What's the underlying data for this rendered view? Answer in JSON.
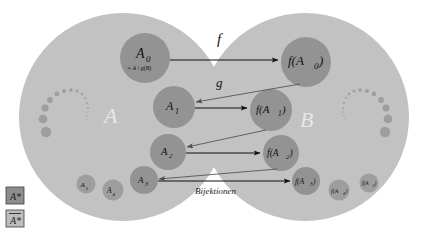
{
  "diagram": {
    "caption": "Bijektionen",
    "colors": {
      "background": "#ffffff",
      "set_fill": "#c2c2c2",
      "subset_fill": "#939393",
      "subset_fill_light": "#9e9e9e",
      "arrow_dark": "#101010",
      "arrow_light": "#5a5a5a",
      "set_label_text": "#e8e8e8",
      "math_text": "#111111",
      "legend_box_dark": "#8d8d8d",
      "legend_box_light": "#bdbdbd",
      "legend_border": "#4a4a4a"
    },
    "sets": [
      {
        "id": "A",
        "label": "A"
      },
      {
        "id": "B",
        "label": "B"
      }
    ],
    "function_labels": [
      {
        "id": "f",
        "label": "f"
      },
      {
        "id": "g",
        "label": "g"
      }
    ],
    "left_subsets": [
      {
        "id": "A0",
        "label": "A",
        "sub": "0",
        "note": "= A \\ g(B)"
      },
      {
        "id": "A1",
        "label": "A",
        "sub": "1",
        "note": ""
      },
      {
        "id": "A2",
        "label": "A",
        "sub": "2",
        "note": ""
      },
      {
        "id": "A3",
        "label": "A",
        "sub": "3",
        "note": ""
      },
      {
        "id": "A4",
        "label": "A",
        "sub": "4",
        "note": ""
      },
      {
        "id": "A5",
        "label": "A",
        "sub": "5",
        "note": ""
      }
    ],
    "right_subsets": [
      {
        "id": "fA0",
        "label": "f(A",
        "sub": "0",
        "close": ")"
      },
      {
        "id": "fA1",
        "label": "f(A",
        "sub": "1",
        "close": ")"
      },
      {
        "id": "fA2",
        "label": "f(A",
        "sub": "2",
        "close": ")"
      },
      {
        "id": "fA3",
        "label": "f(A",
        "sub": "3",
        "close": ")"
      },
      {
        "id": "fA4",
        "label": "f(A",
        "sub": "4",
        "close": ")"
      },
      {
        "id": "fA5",
        "label": "f(A",
        "sub": "5",
        "close": ")"
      }
    ],
    "legend": [
      {
        "id": "legend-astar-dark",
        "label": "A*",
        "style": "dark"
      },
      {
        "id": "legend-astar-bar",
        "label": "A*",
        "style": "overlined"
      }
    ],
    "texts": {
      "A0_main": "A",
      "A0_sub": "0",
      "A0_note": "= A \\ g(B)",
      "A1_main": "A",
      "A1_sub": "1",
      "A2_main": "A",
      "A2_sub": "2",
      "A3_main": "A",
      "A3_sub": "3",
      "A4_main": "A",
      "A4_sub": "4",
      "A5_main": "A",
      "A5_sub": "5",
      "fA0_main": "f(A",
      "fA0_sub": "0",
      "fA0_close": ")",
      "fA1_main": "f(A",
      "fA1_sub": "1",
      "fA1_close": ")",
      "fA2_main": "f(A",
      "fA2_sub": "2",
      "fA2_close": ")",
      "fA3_main": "f(A",
      "fA3_sub": "3",
      "fA3_close": ")",
      "fA4_main": "f(A",
      "fA4_sub": "4",
      "fA4_close": ")",
      "fA5_main": "f(A",
      "fA5_sub": "5",
      "fA5_close": ")",
      "label_A": "A",
      "label_B": "B",
      "label_f": "f",
      "label_g": "g",
      "caption": "Bijektionen",
      "legend1": "A*",
      "legend2": "A*"
    }
  }
}
